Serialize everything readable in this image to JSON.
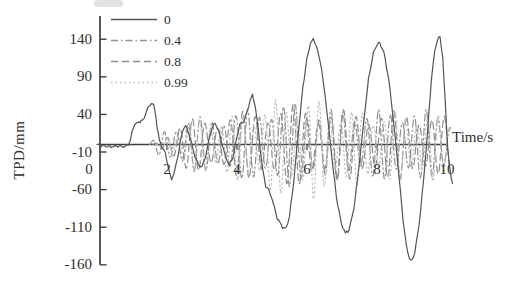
{
  "figure": {
    "background": "#ffffff",
    "axis_color": "#3f3f3f",
    "text_color": "#2f2f2f"
  },
  "chart_data": {
    "type": "line",
    "title": "",
    "xlabel": "Time/s",
    "ylabel": "TPD/mm",
    "xlim": [
      0,
      10
    ],
    "ylim": [
      -160,
      140
    ],
    "xticks": [
      0,
      2,
      4,
      6,
      8,
      10
    ],
    "yticks": [
      140,
      90,
      40,
      -10,
      -60,
      -110,
      -160
    ],
    "grid": false,
    "legend_position": "top-left",
    "series": [
      {
        "name": "0",
        "style": "solid",
        "color": "#545454",
        "points": [
          [
            0,
            0
          ],
          [
            0.2,
            -2
          ],
          [
            0.4,
            -3
          ],
          [
            0.6,
            -2
          ],
          [
            0.8,
            -3
          ],
          [
            0.9,
            0
          ],
          [
            0.95,
            6
          ],
          [
            1.0,
            16
          ],
          [
            1.05,
            24
          ],
          [
            1.1,
            28
          ],
          [
            1.2,
            30
          ],
          [
            1.3,
            32
          ],
          [
            1.35,
            36
          ],
          [
            1.45,
            48
          ],
          [
            1.55,
            55
          ],
          [
            1.62,
            52
          ],
          [
            1.68,
            38
          ],
          [
            1.72,
            22
          ],
          [
            1.78,
            6
          ],
          [
            1.85,
            -2
          ],
          [
            1.95,
            -12
          ],
          [
            2.0,
            -22
          ],
          [
            2.08,
            -40
          ],
          [
            2.13,
            -46
          ],
          [
            2.2,
            -38
          ],
          [
            2.3,
            -18
          ],
          [
            2.4,
            8
          ],
          [
            2.47,
            22
          ],
          [
            2.53,
            25
          ],
          [
            2.6,
            18
          ],
          [
            2.7,
            2
          ],
          [
            2.8,
            -16
          ],
          [
            2.9,
            -27
          ],
          [
            3.0,
            -30
          ],
          [
            3.1,
            -16
          ],
          [
            3.2,
            6
          ],
          [
            3.3,
            24
          ],
          [
            3.38,
            28
          ],
          [
            3.48,
            18
          ],
          [
            3.58,
            0
          ],
          [
            3.68,
            -18
          ],
          [
            3.78,
            -27
          ],
          [
            3.88,
            -18
          ],
          [
            3.98,
            6
          ],
          [
            4.08,
            27
          ],
          [
            4.18,
            30
          ],
          [
            4.28,
            42
          ],
          [
            4.38,
            60
          ],
          [
            4.44,
            65
          ],
          [
            4.52,
            52
          ],
          [
            4.62,
            15
          ],
          [
            4.72,
            -30
          ],
          [
            4.82,
            -55
          ],
          [
            4.9,
            -60
          ],
          [
            5.0,
            -72
          ],
          [
            5.15,
            -98
          ],
          [
            5.3,
            -110
          ],
          [
            5.4,
            -112
          ],
          [
            5.5,
            -95
          ],
          [
            5.62,
            -50
          ],
          [
            5.75,
            15
          ],
          [
            5.88,
            75
          ],
          [
            6.0,
            115
          ],
          [
            6.1,
            135
          ],
          [
            6.18,
            140
          ],
          [
            6.28,
            130
          ],
          [
            6.42,
            100
          ],
          [
            6.56,
            48
          ],
          [
            6.7,
            -12
          ],
          [
            6.84,
            -70
          ],
          [
            6.98,
            -105
          ],
          [
            7.1,
            -118
          ],
          [
            7.2,
            -114
          ],
          [
            7.34,
            -85
          ],
          [
            7.48,
            -32
          ],
          [
            7.62,
            30
          ],
          [
            7.76,
            88
          ],
          [
            7.9,
            122
          ],
          [
            8.0,
            133
          ],
          [
            8.08,
            135
          ],
          [
            8.2,
            122
          ],
          [
            8.34,
            85
          ],
          [
            8.48,
            28
          ],
          [
            8.62,
            -38
          ],
          [
            8.74,
            -98
          ],
          [
            8.84,
            -135
          ],
          [
            8.93,
            -152
          ],
          [
            9.0,
            -155
          ],
          [
            9.08,
            -143
          ],
          [
            9.2,
            -108
          ],
          [
            9.33,
            -48
          ],
          [
            9.45,
            20
          ],
          [
            9.55,
            85
          ],
          [
            9.65,
            125
          ],
          [
            9.73,
            140
          ],
          [
            9.8,
            143
          ],
          [
            9.88,
            115
          ],
          [
            9.95,
            55
          ],
          [
            10.02,
            -5
          ],
          [
            10.1,
            -40
          ],
          [
            10.16,
            -52
          ]
        ]
      },
      {
        "name": "0.4",
        "style": "dash-dot",
        "color": "#949494",
        "synth": {
          "period": 0.34,
          "phase": 0.0,
          "t_end": 10.1,
          "step": 0.02,
          "ampmod_depth": 0.25,
          "ampmod_period": 1.3,
          "neg_scale": 1.0,
          "envelope": [
            [
              1.5,
              0
            ],
            [
              1.8,
              14
            ],
            [
              2.1,
              20
            ],
            [
              2.5,
              28
            ],
            [
              3.0,
              30
            ],
            [
              3.5,
              33
            ],
            [
              4.0,
              36
            ],
            [
              4.5,
              40
            ],
            [
              5.0,
              43
            ],
            [
              5.5,
              45
            ],
            [
              6.0,
              44
            ],
            [
              6.5,
              40
            ],
            [
              7.0,
              38
            ],
            [
              7.5,
              40
            ],
            [
              8.0,
              38
            ],
            [
              8.5,
              37
            ],
            [
              9.0,
              40
            ],
            [
              9.5,
              37
            ],
            [
              10.1,
              30
            ]
          ]
        }
      },
      {
        "name": "0.8",
        "style": "dashed",
        "color": "#8d8d8d",
        "synth": {
          "period": 0.36,
          "phase": 0.8,
          "t_end": 10.1,
          "step": 0.02,
          "ampmod_depth": 0.28,
          "ampmod_period": 1.45,
          "neg_scale": 1.05,
          "envelope": [
            [
              1.6,
              0
            ],
            [
              1.9,
              10
            ],
            [
              2.2,
              18
            ],
            [
              2.6,
              26
            ],
            [
              3.1,
              29
            ],
            [
              3.6,
              31
            ],
            [
              4.1,
              34
            ],
            [
              4.6,
              38
            ],
            [
              5.1,
              41
            ],
            [
              5.6,
              42
            ],
            [
              6.1,
              41
            ],
            [
              6.6,
              38
            ],
            [
              7.1,
              36
            ],
            [
              7.6,
              37
            ],
            [
              8.1,
              36
            ],
            [
              8.6,
              35
            ],
            [
              9.1,
              37
            ],
            [
              9.6,
              34
            ],
            [
              10.1,
              27
            ]
          ]
        }
      },
      {
        "name": "0.99",
        "style": "dotted",
        "color": "#bdbdbd",
        "synth": {
          "period": 0.31,
          "phase": 1.7,
          "t_end": 10.1,
          "step": 0.02,
          "ampmod_depth": 0.3,
          "ampmod_period": 1.15,
          "neg_scale": 1.2,
          "envelope": [
            [
              1.7,
              0
            ],
            [
              2.0,
              8
            ],
            [
              2.3,
              15
            ],
            [
              2.7,
              24
            ],
            [
              3.2,
              27
            ],
            [
              3.7,
              29
            ],
            [
              4.2,
              32
            ],
            [
              4.7,
              40
            ],
            [
              5.1,
              46
            ],
            [
              5.7,
              44
            ],
            [
              6.2,
              48
            ],
            [
              6.7,
              40
            ],
            [
              7.2,
              35
            ],
            [
              7.7,
              36
            ],
            [
              8.2,
              34
            ],
            [
              8.7,
              33
            ],
            [
              9.2,
              35
            ],
            [
              9.7,
              32
            ],
            [
              10.1,
              24
            ]
          ]
        }
      }
    ]
  }
}
